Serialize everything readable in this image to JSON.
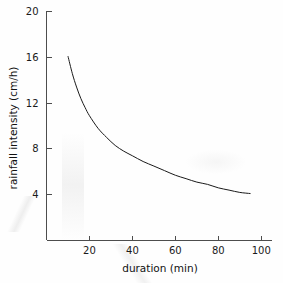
{
  "chart_data": {
    "type": "line",
    "title": "",
    "subtitle": "",
    "xlabel": "duration (min)",
    "ylabel": "rainfall intensity (cm/h)",
    "xlim": [
      0,
      105
    ],
    "ylim": [
      0,
      20
    ],
    "grid": false,
    "legend": null,
    "xticks": [
      20,
      40,
      60,
      80,
      100
    ],
    "xtick_labels": [
      "20",
      "40",
      "60",
      "80",
      "100"
    ],
    "yticks": [
      4,
      8,
      12,
      16,
      20
    ],
    "ytick_labels": [
      "4",
      "8",
      "12",
      "16",
      "20"
    ],
    "series": [
      {
        "name": "rainfall intensity versus duration",
        "color": "#1a1a1a",
        "x": [
          10,
          12,
          14,
          16,
          18,
          20,
          24,
          28,
          32,
          36,
          40,
          45,
          50,
          55,
          60,
          65,
          70,
          75,
          80,
          85,
          90,
          95
        ],
        "y": [
          16.1,
          14.6,
          13.4,
          12.4,
          11.6,
          10.9,
          9.8,
          9.0,
          8.3,
          7.8,
          7.4,
          6.9,
          6.5,
          6.1,
          5.7,
          5.4,
          5.1,
          4.9,
          4.6,
          4.4,
          4.2,
          4.1
        ]
      }
    ]
  },
  "axes": {
    "x_axis_name": "duration-axis",
    "y_axis_name": "rainfall-intensity-axis"
  }
}
